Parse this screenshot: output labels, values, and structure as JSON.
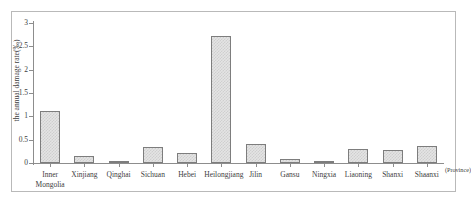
{
  "chart_data": {
    "type": "bar",
    "title": "",
    "xlabel": "(Province)",
    "ylabel": "the annual damage rate(‰)",
    "ylim": [
      0,
      3
    ],
    "yticks": [
      "0",
      "0.5",
      "1",
      "1.5",
      "2",
      "2.5",
      "3"
    ],
    "ytick_values": [
      0,
      0.5,
      1,
      1.5,
      2,
      2.5,
      3
    ],
    "grid": false,
    "legend": false,
    "categories": [
      "Inner\nMongolia",
      "Xinjiang",
      "Qinghai",
      "Sichuan",
      "Hebei",
      "Heilongjiang",
      "Jilin",
      "Gansu",
      "Ningxia",
      "Liaoning",
      "Shanxi",
      "Shaanxi"
    ],
    "values": [
      1.12,
      0.15,
      0.03,
      0.35,
      0.22,
      2.72,
      0.4,
      0.09,
      0.05,
      0.3,
      0.27,
      0.37
    ],
    "bar_fill_color": "#e4e4e4",
    "bar_edge_color": "#7d7d7d",
    "axis_color": "#8d8d8d",
    "frame_color": "#b9b9b9",
    "background_color": "#ffffff"
  }
}
